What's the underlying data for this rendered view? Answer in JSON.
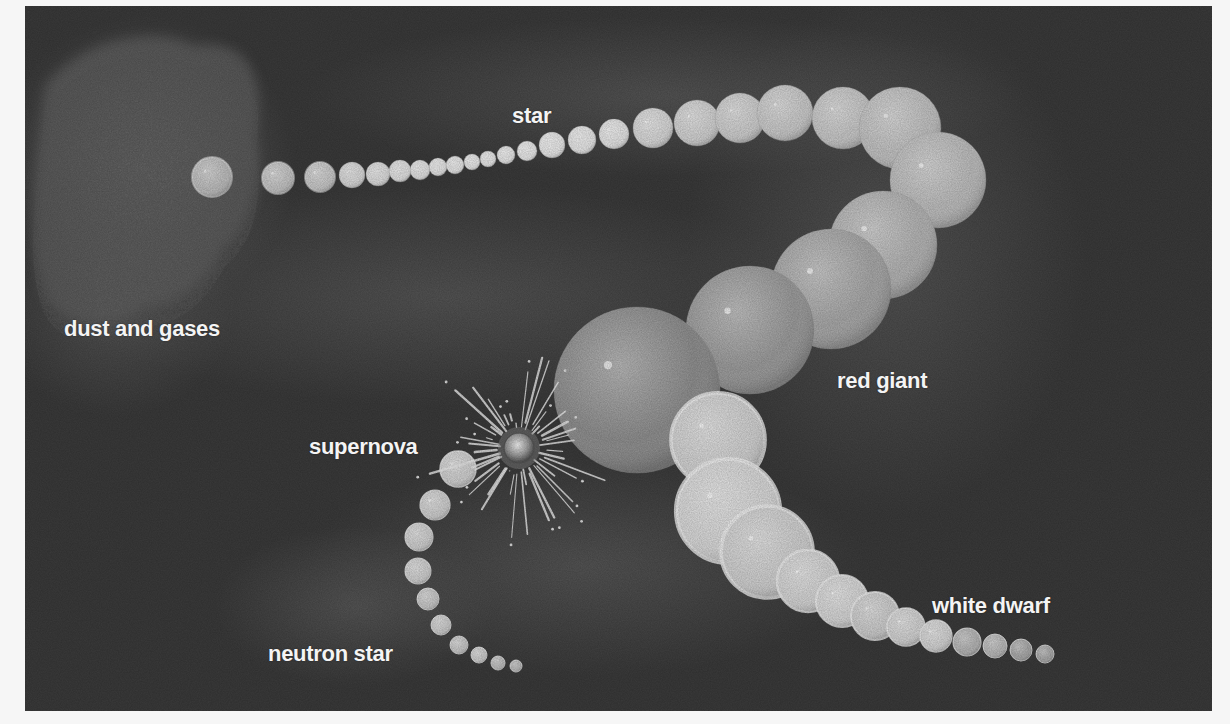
{
  "figure": {
    "colors": {
      "background": "#3a3a3a",
      "haze": "#6c6c6c",
      "label": "#f4f4f4",
      "page": "#f6f6f6"
    },
    "labels": [
      {
        "id": "dust-and-gases",
        "text": "dust and gases",
        "x": 39,
        "y": 312
      },
      {
        "id": "star",
        "text": "star",
        "x": 487,
        "y": 99
      },
      {
        "id": "red-giant",
        "text": "red giant",
        "x": 812,
        "y": 364
      },
      {
        "id": "supernova",
        "text": "supernova",
        "x": 284,
        "y": 430
      },
      {
        "id": "neutron-star",
        "text": "neutron star",
        "x": 243,
        "y": 637
      },
      {
        "id": "white-dwarf",
        "text": "white dwarf",
        "x": 907,
        "y": 589
      }
    ],
    "chain_main": [
      [
        187,
        171,
        20,
        "#bdbdbd"
      ],
      [
        253,
        172,
        16,
        "#c4c4c4"
      ],
      [
        295,
        171,
        15,
        "#c8c8c8"
      ],
      [
        327,
        169,
        13,
        "#d8d8d8"
      ],
      [
        353,
        168,
        12,
        "#dcdcdc"
      ],
      [
        375,
        165,
        11,
        "#e0e0e0"
      ],
      [
        395,
        164,
        10,
        "#e2e2e2"
      ],
      [
        413,
        161,
        9,
        "#e4e4e4"
      ],
      [
        430,
        159,
        9,
        "#e4e4e4"
      ],
      [
        447,
        156,
        8,
        "#e6e6e6"
      ],
      [
        463,
        153,
        8,
        "#e6e6e6"
      ],
      [
        481,
        149,
        9,
        "#e6e6e6"
      ],
      [
        502,
        145,
        10,
        "#e8e8e8"
      ],
      [
        527,
        139,
        13,
        "#e8e8e8"
      ],
      [
        557,
        134,
        14,
        "#e6e6e6"
      ],
      [
        589,
        128,
        15,
        "#e4e4e4"
      ],
      [
        628,
        122,
        20,
        "#d8d8d8"
      ],
      [
        672,
        117,
        23,
        "#d2d2d2"
      ],
      [
        715,
        112,
        25,
        "#cecece"
      ],
      [
        760,
        107,
        28,
        "#cacaca"
      ],
      [
        818,
        112,
        31,
        "#c8c8c8"
      ],
      [
        875,
        122,
        41,
        "#c2c2c2"
      ],
      [
        913,
        174,
        48,
        "#bdbdbd"
      ],
      [
        858,
        239,
        54,
        "#b4b4b4"
      ],
      [
        806,
        283,
        60,
        "#a8a8a8"
      ],
      [
        725,
        324,
        64,
        "#9c9c9c"
      ],
      [
        612,
        384,
        83,
        "#8f8f8f"
      ]
    ],
    "chain_white": [
      [
        693,
        434,
        47,
        "#d2d2d2"
      ],
      [
        703,
        505,
        52,
        "#d8d8d8"
      ],
      [
        742,
        546,
        46,
        "#d0d0d0"
      ],
      [
        783,
        575,
        31,
        "#d4d4d4"
      ],
      [
        817,
        595,
        26,
        "#d6d6d6"
      ],
      [
        850,
        610,
        24,
        "#cccccc"
      ],
      [
        881,
        621,
        19,
        "#d2d2d2"
      ],
      [
        911,
        630,
        16,
        "#d4d4d4"
      ],
      [
        942,
        636,
        14,
        "#b4b4b4"
      ],
      [
        970,
        640,
        12,
        "#b8b8b8"
      ],
      [
        996,
        644,
        11,
        "#a8a8a8"
      ],
      [
        1020,
        648,
        9,
        "#a8a8a8"
      ]
    ],
    "chain_neutron": [
      [
        433,
        463,
        18,
        "#cfcfcf"
      ],
      [
        410,
        499,
        15,
        "#cfcfcf"
      ],
      [
        394,
        531,
        14,
        "#cfcfcf"
      ],
      [
        393,
        565,
        13,
        "#cfcfcf"
      ],
      [
        403,
        593,
        11,
        "#c8c8c8"
      ],
      [
        416,
        619,
        10,
        "#cccccc"
      ],
      [
        434,
        639,
        9,
        "#c8c8c8"
      ],
      [
        454,
        649,
        8,
        "#cccccc"
      ],
      [
        473,
        657,
        7,
        "#bdbdbd"
      ],
      [
        491,
        660,
        6,
        "#b8b8b8"
      ]
    ],
    "supernova": {
      "cx": 494,
      "cy": 442,
      "core_r": 15,
      "ray_count": 44,
      "ray_min": 22,
      "ray_max": 95
    }
  }
}
